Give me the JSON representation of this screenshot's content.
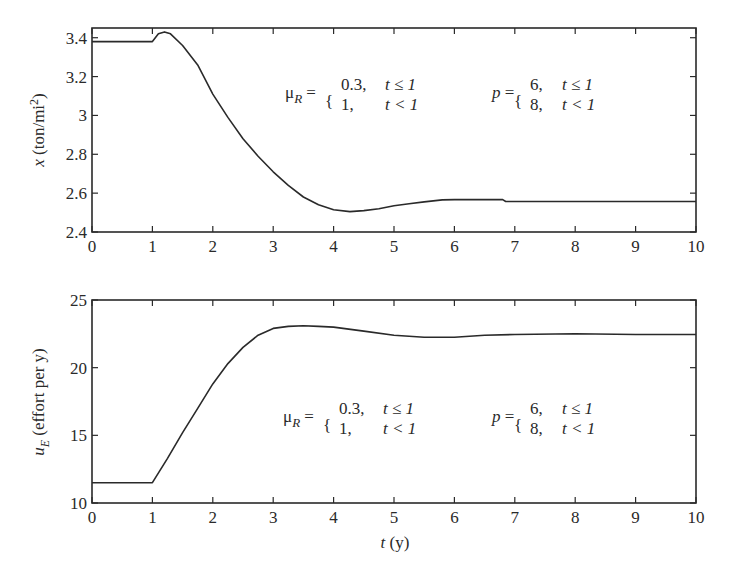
{
  "chart_data": [
    {
      "type": "line",
      "title": "",
      "xlabel": "",
      "ylabel": "x (ton/mi²)",
      "xlim": [
        0,
        10
      ],
      "ylim": [
        2.4,
        3.45
      ],
      "xticks": [
        "0",
        "1",
        "2",
        "3",
        "4",
        "5",
        "6",
        "7",
        "8",
        "9",
        "10"
      ],
      "yticks": [
        "2.4",
        "2.6",
        "2.8",
        "3",
        "3.2",
        "3.4"
      ],
      "grid": false,
      "series": [
        {
          "name": "x",
          "x": [
            0,
            1.0,
            1.1,
            1.2,
            1.3,
            1.5,
            1.75,
            2.0,
            2.25,
            2.5,
            2.75,
            3.0,
            3.25,
            3.5,
            3.75,
            4.0,
            4.27,
            4.5,
            4.75,
            5.0,
            5.25,
            5.5,
            5.8,
            6.0,
            6.5,
            6.8,
            6.85,
            7.0,
            8.0,
            9.0,
            10.0
          ],
          "y": [
            3.38,
            3.38,
            3.42,
            3.43,
            3.42,
            3.36,
            3.26,
            3.11,
            2.99,
            2.88,
            2.79,
            2.71,
            2.64,
            2.58,
            2.54,
            2.515,
            2.505,
            2.51,
            2.52,
            2.535,
            2.545,
            2.555,
            2.565,
            2.567,
            2.567,
            2.567,
            2.557,
            2.557,
            2.557,
            2.557,
            2.557
          ]
        }
      ],
      "annotations": [
        {
          "text": "μR = {0.3, t ≤ 1 ; 1, t < 1}"
        },
        {
          "text": "p = {6, t ≤ 1 ; 8, t < 1}"
        }
      ]
    },
    {
      "type": "line",
      "title": "",
      "xlabel": "t (y)",
      "ylabel": "uE (effort per y)",
      "xlim": [
        0,
        10
      ],
      "ylim": [
        10,
        25
      ],
      "xticks": [
        "0",
        "1",
        "2",
        "3",
        "4",
        "5",
        "6",
        "7",
        "8",
        "9",
        "10"
      ],
      "yticks": [
        "10",
        "15",
        "20",
        "25"
      ],
      "grid": false,
      "series": [
        {
          "name": "uE",
          "x": [
            0,
            1.0,
            1.25,
            1.5,
            1.75,
            2.0,
            2.25,
            2.5,
            2.75,
            3.0,
            3.25,
            3.5,
            3.75,
            4.0,
            4.5,
            5.0,
            5.5,
            6.0,
            6.5,
            7.0,
            8.0,
            9.0,
            10.0
          ],
          "y": [
            11.5,
            11.5,
            13.3,
            15.2,
            17.0,
            18.8,
            20.3,
            21.5,
            22.4,
            22.9,
            23.05,
            23.1,
            23.05,
            23.0,
            22.7,
            22.4,
            22.25,
            22.25,
            22.4,
            22.45,
            22.5,
            22.45,
            22.45
          ]
        }
      ],
      "annotations": [
        {
          "text": "μR = {0.3, t ≤ 1 ; 1, t < 1}"
        },
        {
          "text": "p = {6, t ≤ 1 ; 8, t < 1}"
        }
      ]
    }
  ],
  "labels": {
    "top_ylabel_var": "x",
    "top_ylabel_unit": " (ton/mi",
    "top_ylabel_sup": "2",
    "top_ylabel_close": ")",
    "bottom_ylabel_var": "u",
    "bottom_ylabel_sub": "E",
    "bottom_ylabel_unit": " (effort per y)",
    "xlabel_var": "t",
    "xlabel_unit": " (y)"
  },
  "annot": {
    "mu": "μ",
    "mu_sub": "R",
    "eq": " =",
    "mu_v1": "0.3,",
    "mu_v2": "1,",
    "cond1": "t ≤ 1",
    "cond2": "t < 1",
    "p": "p",
    "p_v1": "6,",
    "p_v2": "8,",
    "brace": "{"
  }
}
